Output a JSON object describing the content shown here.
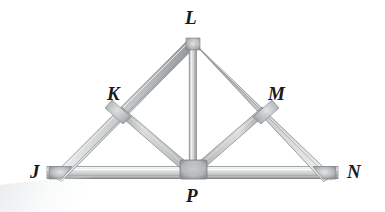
{
  "figure": {
    "kind": "geometry-diagram",
    "background_color": "#ffffff",
    "label_color": "#1a1a1a",
    "beam_colors": {
      "highlight": "#f2f3f4",
      "body": "#c9cbcd",
      "shadow": "#8f9294",
      "edge": "#74777a",
      "joint": "#9a9d9f"
    }
  },
  "vertices": {
    "J": {
      "label": "J",
      "label_x": 30,
      "label_y": 162,
      "point_x": 57,
      "point_y": 172
    },
    "K": {
      "label": "K",
      "label_x": 107,
      "label_y": 84,
      "point_x": 126,
      "point_y": 112
    },
    "L": {
      "label": "L",
      "label_x": 185,
      "label_y": 8,
      "point_x": 193,
      "point_y": 42
    },
    "M": {
      "label": "M",
      "label_x": 268,
      "label_y": 84,
      "point_x": 258,
      "point_y": 112
    },
    "N": {
      "label": "N",
      "label_x": 347,
      "label_y": 162,
      "point_x": 327,
      "point_y": 172
    },
    "P": {
      "label": "P",
      "label_x": 186,
      "label_y": 186,
      "point_x": 193,
      "point_y": 172
    }
  },
  "members": [
    {
      "name": "bottom-chord-JN",
      "from": "J",
      "to": "N"
    },
    {
      "name": "left-rafter-JL",
      "from": "J",
      "to": "L"
    },
    {
      "name": "right-rafter-LN",
      "from": "L",
      "to": "N"
    },
    {
      "name": "king-post-LP",
      "from": "L",
      "to": "P"
    },
    {
      "name": "web-KP",
      "from": "K",
      "to": "P"
    },
    {
      "name": "web-MP",
      "from": "M",
      "to": "P"
    }
  ]
}
